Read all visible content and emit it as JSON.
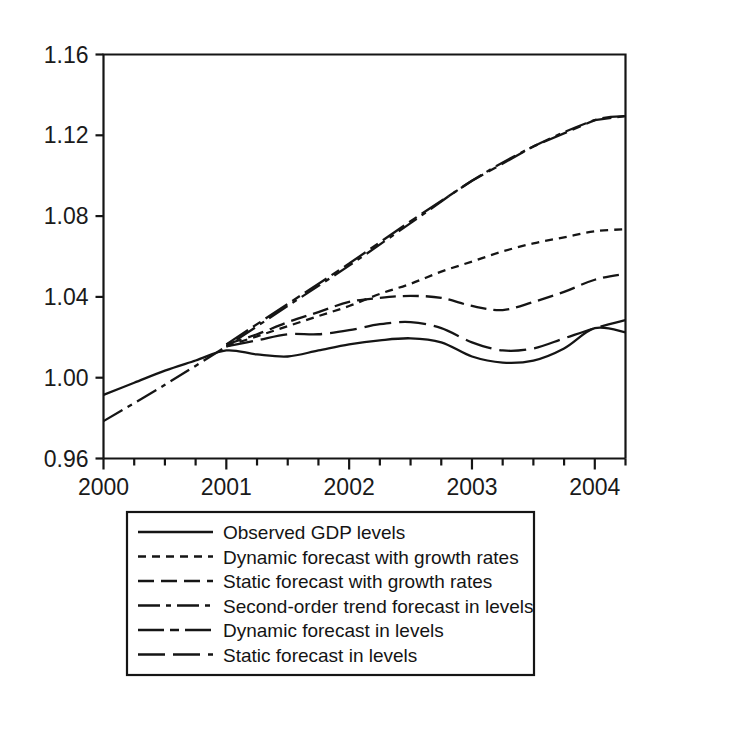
{
  "chart_data": {
    "type": "line",
    "title": "",
    "xlabel": "",
    "ylabel": "",
    "xlim": [
      2000.0,
      2004.25
    ],
    "ylim": [
      0.96,
      1.16
    ],
    "grid": false,
    "legend_position": "below-plot",
    "yticks": [
      "0.96",
      "1.00",
      "1.04",
      "1.08",
      "1.12",
      "1.16"
    ],
    "ytick_values": [
      0.96,
      1.0,
      1.04,
      1.08,
      1.12,
      1.16
    ],
    "xticks": [
      "2000",
      "2001",
      "2002",
      "2003",
      "2004"
    ],
    "xtick_values": [
      2000,
      2001,
      2002,
      2003,
      2004
    ],
    "x_minor_tick_step": 0.25,
    "series": [
      {
        "name": "Observed GDP levels",
        "dash": "solid",
        "x": [
          2000.0,
          2000.25,
          2000.5,
          2000.75,
          2001.0,
          2001.25,
          2001.5,
          2001.75,
          2002.0,
          2002.25,
          2002.5,
          2002.75,
          2003.0,
          2003.25,
          2003.5,
          2003.75,
          2004.0,
          2004.25
        ],
        "values": [
          0.9915,
          0.9975,
          1.0035,
          1.0085,
          1.0135,
          1.0115,
          1.0105,
          1.0135,
          1.0165,
          1.0185,
          1.0195,
          1.0175,
          1.0105,
          1.0075,
          1.0085,
          1.0145,
          1.0245,
          1.0225
        ]
      },
      {
        "name": "Dynamic forecast with growth rates",
        "dash": "dotted-short",
        "x": [
          2001.0,
          2001.25,
          2001.5,
          2001.75,
          2002.0,
          2002.25,
          2002.5,
          2002.75,
          2003.0,
          2003.25,
          2003.5,
          2003.75,
          2004.0,
          2004.25
        ],
        "values": [
          1.0155,
          1.0205,
          1.0255,
          1.0305,
          1.0355,
          1.0415,
          1.0465,
          1.0525,
          1.0575,
          1.0625,
          1.0665,
          1.0695,
          1.0725,
          1.0735
        ]
      },
      {
        "name": "Static forecast with growth rates",
        "dash": "dashed-medium",
        "x": [
          2001.0,
          2001.25,
          2001.5,
          2001.75,
          2002.0,
          2002.25,
          2002.5,
          2002.75,
          2003.0,
          2003.25,
          2003.5,
          2003.75,
          2004.0,
          2004.25
        ],
        "values": [
          1.0165,
          1.0215,
          1.0275,
          1.0325,
          1.0375,
          1.0395,
          1.0405,
          1.0395,
          1.0355,
          1.0335,
          1.0375,
          1.0425,
          1.0485,
          1.0515
        ]
      },
      {
        "name": "Second-order trend forecast in levels",
        "dash": "dash-dot",
        "x": [
          2000.0,
          2000.5,
          2001.0,
          2001.5,
          2002.0,
          2002.5,
          2003.0,
          2003.5,
          2004.0,
          2004.25
        ],
        "values": [
          0.9785,
          0.9965,
          1.0155,
          1.0355,
          1.0555,
          1.0765,
          1.0975,
          1.1145,
          1.1275,
          1.1295
        ]
      },
      {
        "name": "Dynamic forecast in levels",
        "dash": "long-dash-dot",
        "x": [
          2001.0,
          2001.5,
          2002.0,
          2002.5,
          2003.0,
          2003.5,
          2004.0,
          2004.25
        ],
        "values": [
          1.0165,
          1.0365,
          1.0565,
          1.0775,
          1.0975,
          1.1145,
          1.1275,
          1.1295
        ]
      },
      {
        "name": "Static forecast in levels",
        "dash": "long-dash",
        "x": [
          2001.0,
          2001.25,
          2001.5,
          2001.75,
          2002.0,
          2002.25,
          2002.5,
          2002.75,
          2003.0,
          2003.25,
          2003.5,
          2003.75,
          2004.0,
          2004.25
        ],
        "values": [
          1.0155,
          1.0185,
          1.0215,
          1.0215,
          1.0235,
          1.0265,
          1.0275,
          1.0245,
          1.0175,
          1.0135,
          1.0145,
          1.0195,
          1.0245,
          1.0285
        ]
      }
    ]
  },
  "legend": {
    "items": [
      {
        "label": "Observed GDP levels",
        "style": "solid"
      },
      {
        "label": "Dynamic forecast with growth rates",
        "style": "dotted-short"
      },
      {
        "label": "Static forecast with growth rates",
        "style": "dashed-medium"
      },
      {
        "label": "Second-order trend forecast in levels",
        "style": "dash-dot"
      },
      {
        "label": "Dynamic forecast in levels",
        "style": "long-dash-dot"
      },
      {
        "label": "Static forecast in levels",
        "style": "long-dash"
      }
    ]
  },
  "axes": {
    "y_labels": [
      "1.16",
      "1.12",
      "1.08",
      "1.04",
      "1.00",
      "0.96"
    ],
    "x_labels": [
      "2000",
      "2001",
      "2002",
      "2003",
      "2004"
    ]
  },
  "colors": {
    "line": "#151515",
    "axis": "#111111",
    "background": "#ffffff"
  }
}
